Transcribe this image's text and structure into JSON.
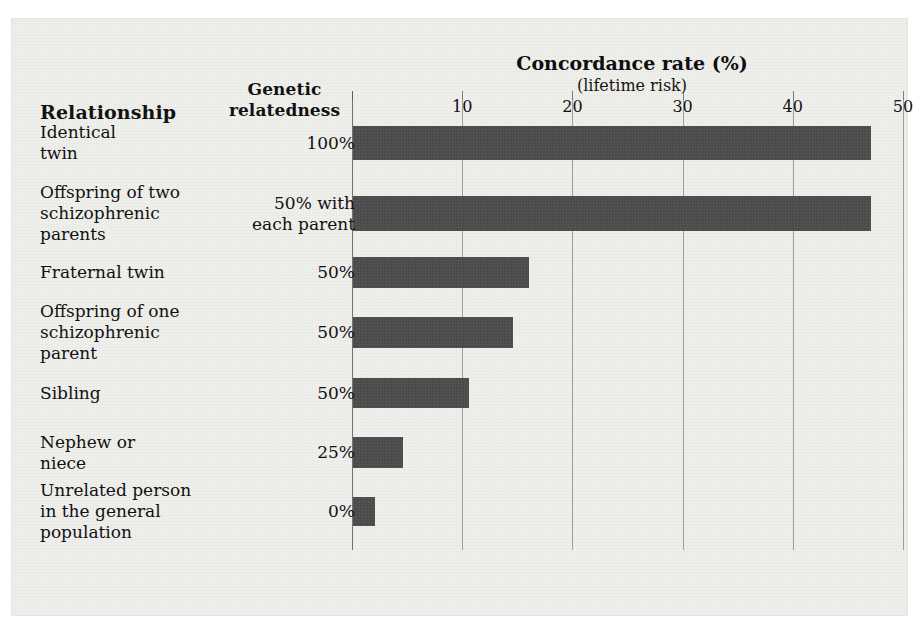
{
  "headers": {
    "relationship": "Relationship",
    "genetic_relatedness": "Genetic relatedness"
  },
  "chart_data": {
    "type": "bar",
    "orientation": "horizontal",
    "title": "Concordance rate (%)",
    "subtitle": "(lifetime risk)",
    "xlabel": "Concordance rate (%)",
    "ylabel": "Relationship",
    "xlim": [
      0,
      50
    ],
    "xticks": [
      10,
      20,
      30,
      40,
      50
    ],
    "xtick_labels": [
      "10",
      "20",
      "30",
      "40",
      "50"
    ],
    "grid": true,
    "legend": "none",
    "bar_color": "#4a4a4a",
    "categories": [
      "Identical twin",
      "Offspring of two schizophrenic parents",
      "Fraternal twin",
      "Offspring of one schizophrenic parent",
      "Sibling",
      "Nephew or niece",
      "Unrelated person in the general population"
    ],
    "values": [
      47,
      47,
      16,
      14.5,
      10.5,
      4.5,
      2
    ],
    "genetic_relatedness": [
      "100%",
      "50% with each parent",
      "50%",
      "50%",
      "50%",
      "25%",
      "0%"
    ]
  },
  "rows": [
    {
      "label_lines": [
        "Identical",
        "twin"
      ],
      "relatedness_lines": [
        "100%"
      ],
      "value": 47
    },
    {
      "label_lines": [
        "Offspring of two",
        "schizophrenic",
        "parents"
      ],
      "relatedness_lines": [
        "50% with",
        "each parent"
      ],
      "value": 47
    },
    {
      "label_lines": [
        "Fraternal twin"
      ],
      "relatedness_lines": [
        "50%"
      ],
      "value": 16
    },
    {
      "label_lines": [
        "Offspring of one",
        "schizophrenic",
        "parent"
      ],
      "relatedness_lines": [
        "50%"
      ],
      "value": 14.5
    },
    {
      "label_lines": [
        "Sibling"
      ],
      "relatedness_lines": [
        "50%"
      ],
      "value": 10.5
    },
    {
      "label_lines": [
        "Nephew or",
        "niece"
      ],
      "relatedness_lines": [
        "25%"
      ],
      "value": 4.5
    },
    {
      "label_lines": [
        "Unrelated person",
        "in the general",
        "population"
      ],
      "relatedness_lines": [
        "0%"
      ],
      "value": 2
    }
  ],
  "row_text": {
    "r0_label": "Identical\ntwin",
    "r0_value": "100%",
    "r1_label": "Offspring of two\nschizophrenic\nparents",
    "r1_value": "50% with\neach parent",
    "r2_label": "Fraternal twin",
    "r2_value": "50%",
    "r3_label": "Offspring of one\nschizophrenic\nparent",
    "r3_value": "50%",
    "r4_label": "Sibling",
    "r4_value": "50%",
    "r5_label": "Nephew or\nniece",
    "r5_value": "25%",
    "r6_label": "Unrelated person\nin the general\npopulation",
    "r6_value": "0%"
  }
}
